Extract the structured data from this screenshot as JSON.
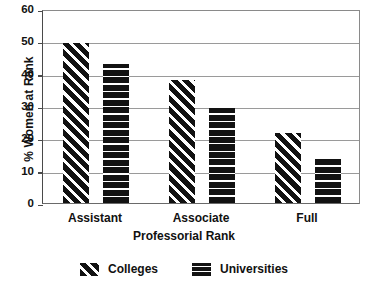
{
  "chart_data": {
    "type": "bar",
    "title": "",
    "xlabel": "Professorial Rank",
    "ylabel": "% Women at Rank",
    "categories": [
      "Assistant",
      "Associate",
      "Full"
    ],
    "series": [
      {
        "name": "Colleges",
        "values": [
          49.5,
          38,
          21.5
        ]
      },
      {
        "name": "Universities",
        "values": [
          43,
          29.5,
          14
        ]
      }
    ],
    "ylim": [
      0,
      60
    ],
    "yticks": [
      0,
      10,
      20,
      30,
      40,
      50,
      60
    ],
    "ytick_labels": [
      "0",
      "10",
      "20",
      "30",
      "40",
      "50",
      "60"
    ],
    "grid": true,
    "legend_position": "bottom",
    "colors": {
      "bar_fill": "#121212",
      "hatch": "#ffffff",
      "grid": "#9a9a9a",
      "axis": "#4a4a4a",
      "background": "#ffffff"
    },
    "patterns": {
      "Colleges": "diagonal-stripes",
      "Universities": "horizontal-stripes"
    }
  },
  "legend": {
    "items": [
      {
        "label": "Colleges",
        "pattern": "diagonal-stripes"
      },
      {
        "label": "Universities",
        "pattern": "horizontal-stripes"
      }
    ]
  }
}
